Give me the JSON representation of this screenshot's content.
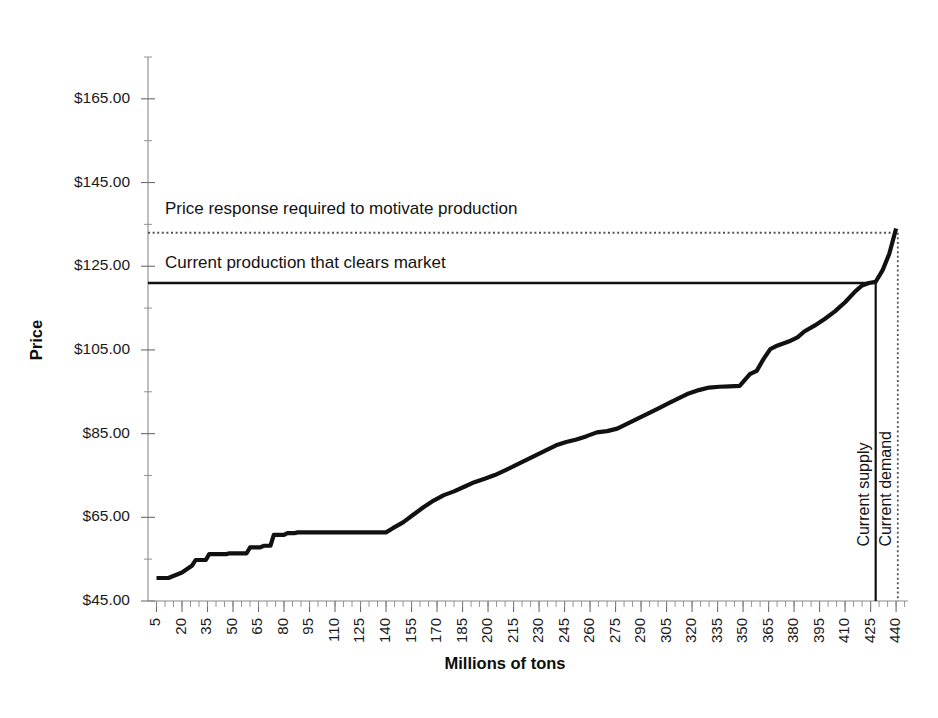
{
  "chart_data": {
    "type": "line",
    "title": "",
    "xlabel": "Millions of tons",
    "ylabel": "Price",
    "xlim": [
      0,
      447
    ],
    "ylim": [
      45,
      175
    ],
    "grid": false,
    "legend": "none",
    "y_ticks": [
      "$45.00",
      "$65.00",
      "$85.00",
      "$105.00",
      "$125.00",
      "$145.00",
      "$165.00"
    ],
    "y_tick_values": [
      45,
      65,
      85,
      105,
      125,
      145,
      165
    ],
    "x_ticks": [
      "5",
      "20",
      "35",
      "50",
      "65",
      "80",
      "95",
      "110",
      "125",
      "140",
      "155",
      "170",
      "185",
      "200",
      "215",
      "230",
      "245",
      "260",
      "275",
      "290",
      "305",
      "320",
      "335",
      "350",
      "365",
      "380",
      "395",
      "410",
      "425",
      "440"
    ],
    "x_tick_values": [
      5,
      20,
      35,
      50,
      65,
      80,
      95,
      110,
      125,
      140,
      155,
      170,
      185,
      200,
      215,
      230,
      245,
      260,
      275,
      290,
      305,
      320,
      335,
      350,
      365,
      380,
      395,
      410,
      425,
      440
    ],
    "series": [
      {
        "name": "Supply cost curve",
        "style": "step-solid",
        "x": [
          5,
          12,
          20,
          26,
          28,
          34,
          36,
          46,
          48,
          58,
          60,
          66,
          68,
          72,
          74,
          80,
          82,
          86,
          88,
          140,
          144,
          150,
          156,
          162,
          168,
          174,
          180,
          186,
          192,
          198,
          204,
          210,
          216,
          222,
          228,
          234,
          240,
          246,
          252,
          258,
          264,
          270,
          276,
          282,
          288,
          294,
          300,
          306,
          312,
          318,
          324,
          330,
          336,
          342,
          348,
          354,
          358,
          362,
          366,
          370,
          374,
          378,
          382,
          386,
          392,
          398,
          404,
          410,
          416,
          420,
          424,
          428,
          432,
          436,
          440
        ],
        "y": [
          50.5,
          50.5,
          51.8,
          53.5,
          54.8,
          54.8,
          56.2,
          56.2,
          56.4,
          56.4,
          57.8,
          57.8,
          58.2,
          58.2,
          60.8,
          60.8,
          61.2,
          61.2,
          61.4,
          61.4,
          62.4,
          63.8,
          65.6,
          67.4,
          69.0,
          70.3,
          71.2,
          72.3,
          73.4,
          74.2,
          75.1,
          76.2,
          77.4,
          78.6,
          79.8,
          81.0,
          82.2,
          83.0,
          83.6,
          84.4,
          85.3,
          85.6,
          86.2,
          87.4,
          88.6,
          89.8,
          91.0,
          92.2,
          93.4,
          94.6,
          95.4,
          96.0,
          96.2,
          96.3,
          96.4,
          99.2,
          100.0,
          102.8,
          105.2,
          106.0,
          106.6,
          107.2,
          108.0,
          109.4,
          110.8,
          112.4,
          114.2,
          116.4,
          119.0,
          120.4,
          121.0,
          121.3,
          124.0,
          128.0,
          134.0
        ]
      }
    ],
    "reference_lines": [
      {
        "name": "price-response-line",
        "orientation": "horizontal",
        "value": 133.0,
        "style": "dotted",
        "label": "Price response required to motivate production"
      },
      {
        "name": "current-production-line",
        "orientation": "horizontal",
        "value": 121.0,
        "style": "solid",
        "label": "Current production that clears market"
      },
      {
        "name": "current-supply-line",
        "orientation": "vertical",
        "value": 428,
        "style": "solid",
        "label": "Current supply"
      },
      {
        "name": "current-demand-line",
        "orientation": "vertical",
        "value": 441,
        "style": "dotted",
        "label": "Current demand"
      }
    ],
    "annotations": [
      {
        "text": "Price response required to motivate production",
        "x": 10,
        "y": 137.5
      },
      {
        "text": "Current production that clears market",
        "x": 10,
        "y": 124.5
      },
      {
        "text": "Current supply",
        "x": 424,
        "y": 58,
        "rotation": -90
      },
      {
        "text": "Current demand",
        "x": 437,
        "y": 58,
        "rotation": -90
      }
    ],
    "colors": {
      "curve": "#111111",
      "clearing_line": "#111111",
      "response_line": "#555555",
      "axis": "#8a8a8a",
      "text": "#1a1a1a",
      "background": "#ffffff"
    }
  }
}
